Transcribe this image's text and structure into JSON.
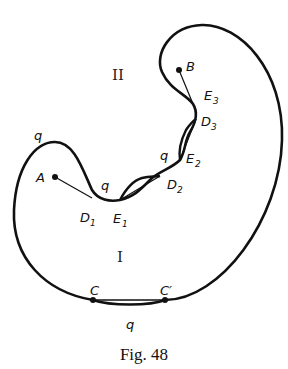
{
  "figure": {
    "caption": "Fig. 48",
    "regions": {
      "upper": "II",
      "lower": "I"
    },
    "points": [
      {
        "id": "A",
        "label": "A",
        "sub": ""
      },
      {
        "id": "B",
        "label": "B",
        "sub": ""
      },
      {
        "id": "C",
        "label": "C",
        "sub": ""
      },
      {
        "id": "C_prime",
        "label": "C′",
        "sub": ""
      },
      {
        "id": "D1",
        "label": "D",
        "sub": "1"
      },
      {
        "id": "D2",
        "label": "D",
        "sub": "2"
      },
      {
        "id": "D3",
        "label": "D",
        "sub": "3"
      },
      {
        "id": "E1",
        "label": "E",
        "sub": "1"
      },
      {
        "id": "E2",
        "label": "E",
        "sub": "2"
      },
      {
        "id": "E3",
        "label": "E",
        "sub": "3"
      }
    ],
    "curve_labels": [
      "q",
      "q",
      "q",
      "q"
    ]
  }
}
